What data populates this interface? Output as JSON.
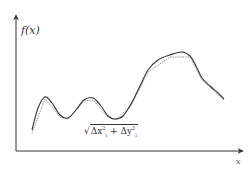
{
  "chart_data": {
    "type": "line",
    "title": "",
    "xlabel": "x",
    "ylabel": "f(x)",
    "grid": false,
    "legend": [],
    "annotations": [
      "√(Δx_i² + Δy_i²)"
    ],
    "series": [
      {
        "name": "f(x) smooth curve",
        "style": "solid",
        "points_px": [
          [
            32,
            130
          ],
          [
            38,
            108
          ],
          [
            45,
            97
          ],
          [
            52,
            103
          ],
          [
            60,
            115
          ],
          [
            68,
            118
          ],
          [
            76,
            110
          ],
          [
            84,
            100
          ],
          [
            93,
            98
          ],
          [
            101,
            106
          ],
          [
            108,
            116
          ],
          [
            115,
            119
          ],
          [
            123,
            116
          ],
          [
            131,
            104
          ],
          [
            140,
            86
          ],
          [
            148,
            70
          ],
          [
            158,
            60
          ],
          [
            170,
            55
          ],
          [
            182,
            52
          ],
          [
            190,
            56
          ],
          [
            196,
            66
          ],
          [
            202,
            78
          ],
          [
            210,
            86
          ],
          [
            218,
            93
          ],
          [
            224,
            99
          ]
        ]
      },
      {
        "name": "polygonal approximation",
        "style": "dotted",
        "points_px": [
          [
            32,
            133
          ],
          [
            45,
            99
          ],
          [
            60,
            117
          ],
          [
            68,
            119
          ],
          [
            84,
            101
          ],
          [
            93,
            100
          ],
          [
            108,
            117
          ],
          [
            115,
            120
          ],
          [
            131,
            106
          ],
          [
            148,
            72
          ],
          [
            170,
            57
          ],
          [
            190,
            57
          ],
          [
            202,
            80
          ],
          [
            224,
            100
          ]
        ]
      }
    ]
  },
  "labels": {
    "y_axis": "f(x)",
    "x_axis": "x",
    "formula": {
      "sqrt_open": "√",
      "dx": "Δx",
      "dx_sub": "i",
      "dx_sup": "2",
      "plus": " + ",
      "dy": "Δy",
      "dy_sub": "i",
      "dy_sup": "2"
    }
  },
  "colors": {
    "axis": "#333333",
    "curve": "#333333",
    "approx": "#888888",
    "background": "#ffffff"
  }
}
